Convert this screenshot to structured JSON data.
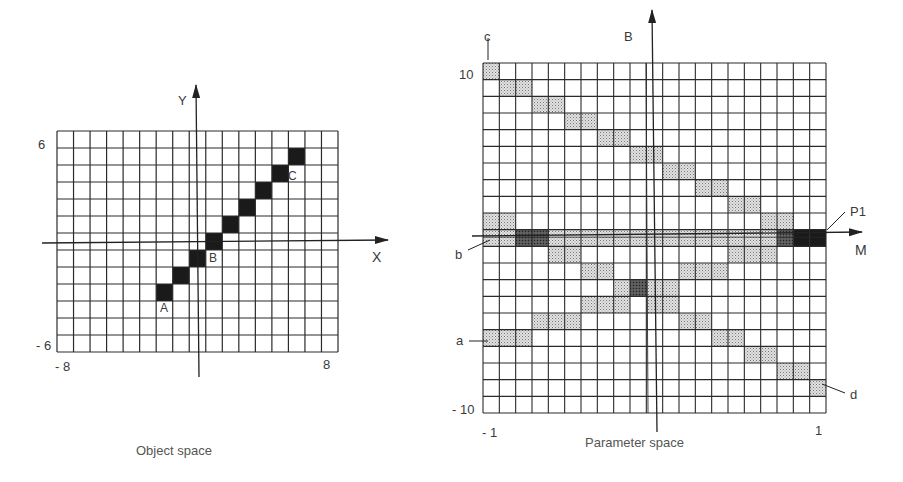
{
  "object_space": {
    "caption": "Object space",
    "x_axis_label": "X",
    "y_axis_label": "Y",
    "y_max_label": "6",
    "y_min_label": "- 6",
    "x_min_label": "- 8",
    "x_max_label": "8",
    "grid": {
      "cols": 17,
      "rows": 13
    },
    "filled_cells": [
      {
        "row": 1,
        "col": 14
      },
      {
        "row": 2,
        "col": 13
      },
      {
        "row": 3,
        "col": 12
      },
      {
        "row": 4,
        "col": 11
      },
      {
        "row": 5,
        "col": 10
      },
      {
        "row": 6,
        "col": 9
      },
      {
        "row": 7,
        "col": 8
      },
      {
        "row": 8,
        "col": 7
      },
      {
        "row": 9,
        "col": 6
      }
    ],
    "point_labels": [
      {
        "id": "A",
        "text": "A"
      },
      {
        "id": "B",
        "text": "B"
      },
      {
        "id": "C",
        "text": "C"
      }
    ]
  },
  "parameter_space": {
    "caption": "Parameter space",
    "x_axis_label": "M",
    "y_axis_label": "B",
    "y_max_label": "10",
    "y_min_label": "- 10",
    "x_min_label": "- 1",
    "x_max_label": "1",
    "grid": {
      "cols": 21,
      "rows": 21,
      "band_row": 10
    },
    "shaded_cells": [
      [
        0,
        0
      ],
      [
        1,
        1
      ],
      [
        1,
        2
      ],
      [
        2,
        3
      ],
      [
        2,
        4
      ],
      [
        3,
        5
      ],
      [
        3,
        6
      ],
      [
        4,
        7
      ],
      [
        4,
        8
      ],
      [
        5,
        9
      ],
      [
        5,
        10
      ],
      [
        6,
        11
      ],
      [
        6,
        12
      ],
      [
        7,
        13
      ],
      [
        7,
        14
      ],
      [
        8,
        15
      ],
      [
        8,
        16
      ],
      [
        9,
        0
      ],
      [
        9,
        1
      ],
      [
        9,
        17
      ],
      [
        9,
        18
      ],
      [
        11,
        4
      ],
      [
        11,
        5
      ],
      [
        11,
        15
      ],
      [
        11,
        16
      ],
      [
        11,
        17
      ],
      [
        12,
        6
      ],
      [
        12,
        7
      ],
      [
        12,
        12
      ],
      [
        12,
        13
      ],
      [
        12,
        14
      ],
      [
        13,
        8
      ],
      [
        13,
        10
      ],
      [
        13,
        11
      ],
      [
        14,
        6
      ],
      [
        14,
        7
      ],
      [
        14,
        8
      ],
      [
        14,
        10
      ],
      [
        14,
        11
      ],
      [
        15,
        3
      ],
      [
        15,
        4
      ],
      [
        15,
        5
      ],
      [
        15,
        12
      ],
      [
        15,
        13
      ],
      [
        16,
        0
      ],
      [
        16,
        1
      ],
      [
        16,
        2
      ],
      [
        16,
        14
      ],
      [
        16,
        15
      ],
      [
        17,
        16
      ],
      [
        17,
        17
      ],
      [
        18,
        18
      ],
      [
        18,
        19
      ],
      [
        19,
        20
      ]
    ],
    "dark_cells": [
      [
        10,
        2
      ],
      [
        10,
        3
      ],
      [
        10,
        18
      ],
      [
        13,
        9
      ]
    ],
    "black_cells": [
      [
        10,
        19
      ],
      [
        10,
        20
      ]
    ],
    "line_labels": [
      {
        "id": "a",
        "text": "a"
      },
      {
        "id": "b",
        "text": "b"
      },
      {
        "id": "c",
        "text": "c"
      },
      {
        "id": "d",
        "text": "d"
      },
      {
        "id": "P1",
        "text": "P1"
      }
    ]
  },
  "colors": {
    "grid_line": "#2a2a2a",
    "fill_black": "#1a1a1a",
    "shade_light": "#c8c8c8",
    "shade_dark": "#6a6a6a",
    "text": "#3a3a3a"
  }
}
